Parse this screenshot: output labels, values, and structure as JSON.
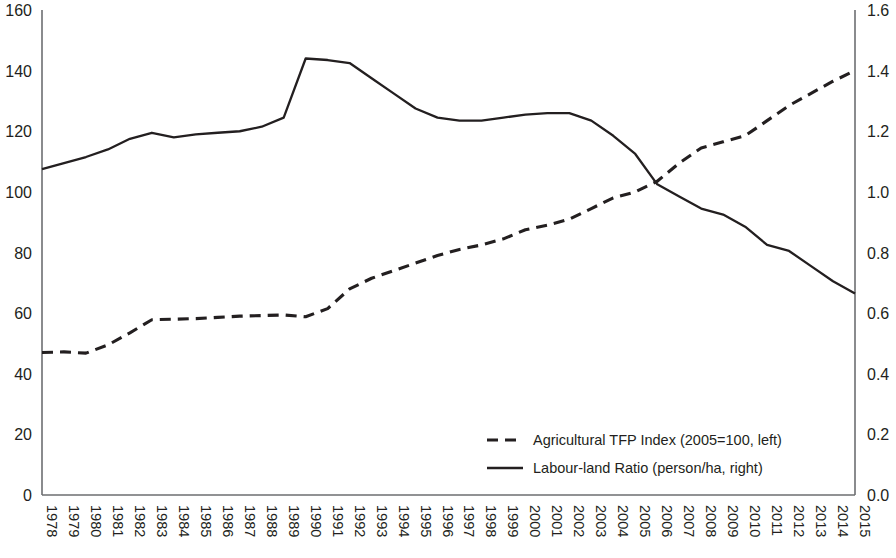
{
  "chart_data": {
    "type": "line",
    "title": "",
    "xlabel": "",
    "grid": false,
    "legend_position": "inside-bottom-right",
    "categories": [
      "1978",
      "1979",
      "1980",
      "1981",
      "1982",
      "1983",
      "1984",
      "1985",
      "1986",
      "1987",
      "1988",
      "1989",
      "1990",
      "1991",
      "1992",
      "1993",
      "1994",
      "1995",
      "1996",
      "1997",
      "1998",
      "1999",
      "2000",
      "2001",
      "2002",
      "2003",
      "2004",
      "2005",
      "2006",
      "2007",
      "2008",
      "2009",
      "2010",
      "2011",
      "2012",
      "2013",
      "2014",
      "2015"
    ],
    "left_axis": {
      "label": "",
      "ylim": [
        0,
        160
      ],
      "ticks": [
        0,
        20,
        40,
        60,
        80,
        100,
        120,
        140,
        160
      ],
      "tick_labels": [
        "0",
        "20",
        "40",
        "60",
        "80",
        "100",
        "120",
        "140",
        "160"
      ]
    },
    "right_axis": {
      "label": "",
      "ylim": [
        0.0,
        1.6
      ],
      "ticks": [
        0.0,
        0.2,
        0.4,
        0.6,
        0.8,
        1.0,
        1.2,
        1.4,
        1.6
      ],
      "tick_labels": [
        "0.0",
        "0.2",
        "0.4",
        "0.6",
        "0.8",
        "1.0",
        "1.2",
        "1.4",
        "1.6"
      ]
    },
    "series": [
      {
        "name": "Agricultural TFP Index (2005=100, left)",
        "axis": "left",
        "style": "dashed",
        "color": "#231f20",
        "values": [
          47.0,
          47.2,
          46.8,
          49.5,
          53.5,
          57.8,
          58.0,
          58.2,
          58.6,
          59.0,
          59.2,
          59.4,
          58.8,
          61.5,
          68.0,
          71.5,
          74.0,
          76.5,
          79.0,
          81.0,
          82.5,
          84.5,
          87.5,
          89.0,
          91.0,
          94.5,
          98.0,
          100.0,
          103.5,
          109.5,
          114.5,
          116.5,
          118.5,
          123.5,
          128.5,
          132.5,
          136.5,
          140.0
        ]
      },
      {
        "name": "Labour-land Ratio (person/ha, right)",
        "axis": "right",
        "style": "solid",
        "color": "#231f20",
        "values": [
          1.075,
          1.095,
          1.115,
          1.14,
          1.175,
          1.195,
          1.18,
          1.19,
          1.195,
          1.2,
          1.215,
          1.245,
          1.44,
          1.435,
          1.425,
          1.375,
          1.325,
          1.275,
          1.245,
          1.235,
          1.235,
          1.245,
          1.255,
          1.26,
          1.26,
          1.235,
          1.185,
          1.125,
          1.025,
          0.985,
          0.945,
          0.925,
          0.885,
          0.825,
          0.805,
          0.755,
          0.705,
          0.665
        ]
      }
    ],
    "legend": [
      {
        "label": "Agricultural TFP Index (2005=100, left)",
        "style": "dashed"
      },
      {
        "label": "Labour-land Ratio (person/ha, right)",
        "style": "solid"
      }
    ]
  },
  "colors": {
    "ink": "#231f20",
    "axis": "#6d6e71",
    "background": "#ffffff"
  }
}
